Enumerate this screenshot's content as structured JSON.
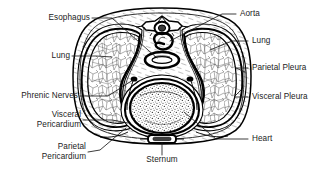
{
  "figure": {
    "view": "axial cross-section",
    "ink_color": "#000000",
    "background_color": "#ffffff",
    "text_color": "#1b1b1b"
  },
  "labels": {
    "esophagus": "Esophagus",
    "lung_left": "Lung",
    "phrenic_nerves": "Phrenic Nerves",
    "visceral_pericardium_line1": "Visceral",
    "visceral_pericardium_line2": "Pericardium",
    "parietal_pericardium_line1": "Parietal",
    "parietal_pericardium_line2": "Pericardium",
    "sternum": "Sternum",
    "aorta": "Aorta",
    "lung_right": "Lung",
    "parietal_pleura": "Parietal Pleura",
    "visceral_pleura": "Visceral Pleura",
    "heart": "Heart"
  },
  "structures": [
    {
      "name": "vertebra",
      "position": "top-center"
    },
    {
      "name": "aorta",
      "position": "upper-center"
    },
    {
      "name": "esophagus",
      "position": "center-upper"
    },
    {
      "name": "left-lung",
      "position": "left"
    },
    {
      "name": "right-lung",
      "position": "right"
    },
    {
      "name": "heart",
      "position": "lower-center"
    },
    {
      "name": "sternum",
      "position": "bottom-center"
    },
    {
      "name": "phrenic-nerves",
      "position": "flanking-heart"
    },
    {
      "name": "parietal-pleura",
      "position": "outer-lung-lining"
    },
    {
      "name": "visceral-pleura",
      "position": "inner-lung-lining"
    },
    {
      "name": "parietal-pericardium",
      "position": "outer-heart-sac"
    },
    {
      "name": "visceral-pericardium",
      "position": "inner-heart-sac"
    },
    {
      "name": "thoracic-wall",
      "position": "outer-boundary"
    }
  ]
}
